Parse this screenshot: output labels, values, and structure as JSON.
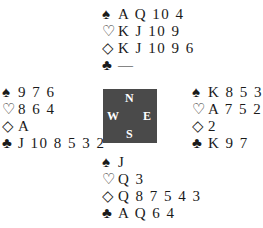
{
  "deal": {
    "north": {
      "spades": {
        "symbol": "♠",
        "cards": "A Q 10 4"
      },
      "hearts": {
        "symbol": "♡",
        "cards": "K J 10 9"
      },
      "diamonds": {
        "symbol": "◇",
        "cards": "K J 10 9 6"
      },
      "clubs": {
        "symbol": "♣",
        "cards": "—"
      }
    },
    "west": {
      "spades": {
        "symbol": "♠",
        "cards": "9 7 6"
      },
      "hearts": {
        "symbol": "♡",
        "cards": "8 6 4"
      },
      "diamonds": {
        "symbol": "◇",
        "cards": "A"
      },
      "clubs": {
        "symbol": "♣",
        "cards": "J 10 8 5 3 2"
      }
    },
    "east": {
      "spades": {
        "symbol": "♠",
        "cards": "K 8 5 3 2"
      },
      "hearts": {
        "symbol": "♡",
        "cards": "A 7 5 2"
      },
      "diamonds": {
        "symbol": "◇",
        "cards": "2"
      },
      "clubs": {
        "symbol": "♣",
        "cards": "K 9 7"
      }
    },
    "south": {
      "spades": {
        "symbol": "♠",
        "cards": "J"
      },
      "hearts": {
        "symbol": "♡",
        "cards": "Q 3"
      },
      "diamonds": {
        "symbol": "◇",
        "cards": "Q 8 7 5 4 3"
      },
      "clubs": {
        "symbol": "♣",
        "cards": "A Q 6 4"
      }
    }
  },
  "compass": {
    "n": "N",
    "s": "S",
    "w": "W",
    "e": "E",
    "background": "#4a4a4a"
  }
}
